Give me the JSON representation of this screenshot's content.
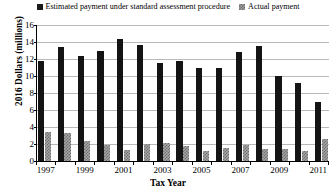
{
  "chart_data": {
    "type": "bar",
    "title": "",
    "xlabel": "Tax Year",
    "ylabel": "2016 Dollars (millions)",
    "ylim": [
      0,
      16
    ],
    "ytick_step": 2,
    "yticks": [
      "0",
      "2",
      "4",
      "6",
      "8",
      "10",
      "12",
      "14",
      "16"
    ],
    "grid": true,
    "legend_position": "top-center",
    "categories": [
      "1997",
      "1998",
      "1999",
      "2000",
      "2001",
      "2002",
      "2003",
      "2004",
      "2005",
      "2006",
      "2007",
      "2008",
      "2009",
      "2010",
      "2011"
    ],
    "xtick_labels": [
      "1997",
      "1999",
      "2001",
      "2003",
      "2005",
      "2007",
      "2009",
      "2011"
    ],
    "series": [
      {
        "name": "Estimated payment under standard assessment procedure",
        "marker": "filled-square",
        "color": "#141414",
        "values": [
          11.8,
          13.4,
          12.4,
          12.9,
          14.4,
          13.7,
          11.5,
          11.8,
          10.9,
          11.0,
          12.8,
          13.5,
          10.0,
          9.2,
          7.0
        ]
      },
      {
        "name": "Actual payment",
        "marker": "hatched-square",
        "color": "#a6a6a6",
        "values": [
          3.4,
          3.3,
          2.4,
          1.9,
          1.3,
          2.0,
          2.1,
          1.8,
          1.2,
          1.5,
          1.9,
          1.4,
          1.4,
          1.2,
          2.6
        ]
      }
    ]
  }
}
